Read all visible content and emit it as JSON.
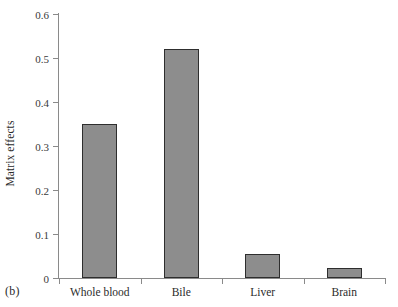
{
  "panel": {
    "tag": "(b)"
  },
  "chart_data": {
    "type": "bar",
    "title": "",
    "subtitle": "",
    "xlabel": "",
    "ylabel": "Matrix effects",
    "categories": [
      "Whole blood",
      "Bile",
      "Liver",
      "Brain"
    ],
    "values": [
      0.35,
      0.52,
      0.055,
      0.023
    ],
    "ylim": [
      0,
      0.6
    ],
    "ytick_labels": [
      "0",
      "0.1",
      "0.2",
      "0.3",
      "0.4",
      "0.5",
      "0.6"
    ],
    "ytick_values": [
      0,
      0.1,
      0.2,
      0.3,
      0.4,
      0.5,
      0.6
    ],
    "grid": false,
    "legend": false,
    "legend_position": "none",
    "bar_fill_color": "#8d8d8d",
    "bar_border_color": "#2e2e2e",
    "axis_color": "#8a8a8a",
    "background_color": "#ffffff"
  }
}
